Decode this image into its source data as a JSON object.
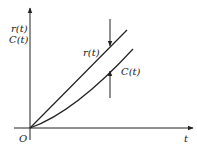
{
  "diagram": {
    "y_axis_label_line1": "r(t)",
    "y_axis_label_line2": "C(t)",
    "x_axis_label": "t",
    "origin_label": "O",
    "curve_r_label": "r(t)",
    "curve_c_label": "C(t)",
    "color": "#222222"
  }
}
